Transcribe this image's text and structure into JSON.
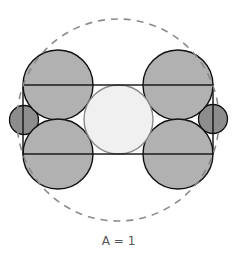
{
  "caption": "A = 1",
  "colors": {
    "background": "#ffffff",
    "large_circle_fill": "#b1b1b1",
    "small_circle_fill": "#8d8d8d",
    "center_circle_fill": "#f0f0f0",
    "center_circle_stroke": "#8a8a8a",
    "outline_stroke": "#111111",
    "dashed_circle_stroke": "#8a8a8a",
    "caption_color": "#555555"
  },
  "shapes": {
    "bounding_dashed_circle": {
      "cx": 118,
      "cy": 120,
      "r": 101
    },
    "rectangle": {
      "x": 23,
      "y": 85,
      "width": 190,
      "height": 69
    },
    "large_circles": [
      {
        "name": "top-left",
        "cx": 58,
        "cy": 85,
        "r": 35
      },
      {
        "name": "top-right",
        "cx": 178,
        "cy": 85,
        "r": 35
      },
      {
        "name": "bottom-left",
        "cx": 58,
        "cy": 154,
        "r": 35
      },
      {
        "name": "bottom-right",
        "cx": 178,
        "cy": 154,
        "r": 35
      }
    ],
    "center_circle": {
      "cx": 118,
      "cy": 119.5,
      "r": 34.5
    },
    "small_circles": [
      {
        "name": "left",
        "cx": 24,
        "cy": 120,
        "r": 14.5
      },
      {
        "name": "right",
        "cx": 213,
        "cy": 119,
        "r": 14.5
      }
    ]
  }
}
